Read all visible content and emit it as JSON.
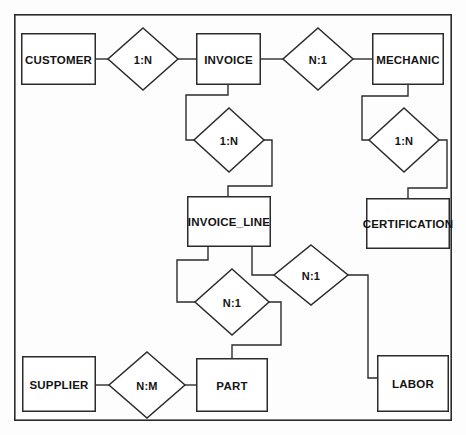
{
  "diagram": {
    "type": "entity-relationship-diagram",
    "title": "",
    "canvas": {
      "width": 466,
      "height": 435,
      "background": "#fdfdfd"
    },
    "frame": {
      "x": 14,
      "y": 14,
      "width": 438,
      "height": 407,
      "stroke": "#2b2b2b"
    },
    "style": {
      "entity_fill": "#ffffff",
      "entity_stroke": "#2b2b2b",
      "relationship_fill": "#ffffff",
      "relationship_stroke": "#2b2b2b",
      "edge_stroke": "#2b2b2b",
      "text_color": "#141414"
    },
    "entities": [
      {
        "id": "customer",
        "label": "CUSTOMER",
        "x": 21,
        "y": 33,
        "width": 75,
        "height": 52
      },
      {
        "id": "invoice",
        "label": "INVOICE",
        "x": 196,
        "y": 33,
        "width": 65,
        "height": 52
      },
      {
        "id": "mechanic",
        "label": "MECHANIC",
        "x": 372,
        "y": 33,
        "width": 72,
        "height": 52
      },
      {
        "id": "invoice_line",
        "label": "INVOICE_LINE",
        "x": 187,
        "y": 196,
        "width": 84,
        "height": 51
      },
      {
        "id": "certification",
        "label": "CERTIFICATION",
        "x": 366,
        "y": 198,
        "width": 84,
        "height": 51
      },
      {
        "id": "supplier",
        "label": "SUPPLIER",
        "x": 22,
        "y": 356,
        "width": 74,
        "height": 56
      },
      {
        "id": "part",
        "label": "PART",
        "x": 196,
        "y": 358,
        "width": 72,
        "height": 54
      },
      {
        "id": "labor",
        "label": "LABOR",
        "x": 377,
        "y": 355,
        "width": 72,
        "height": 57
      }
    ],
    "relationships": [
      {
        "id": "rel-customer-invoice",
        "label": "1:N",
        "cx": 143,
        "cy": 59,
        "rx": 35,
        "ry": 31,
        "from": "customer",
        "to": "invoice"
      },
      {
        "id": "rel-invoice-mechanic",
        "label": "N:1",
        "cx": 318,
        "cy": 59,
        "rx": 35,
        "ry": 31,
        "from": "invoice",
        "to": "mechanic"
      },
      {
        "id": "rel-invoice-invoiceline",
        "label": "1:N",
        "cx": 229,
        "cy": 140,
        "rx": 35,
        "ry": 32,
        "from": "invoice",
        "to": "invoice_line"
      },
      {
        "id": "rel-mechanic-certification",
        "label": "1:N",
        "cx": 404,
        "cy": 140,
        "rx": 35,
        "ry": 32,
        "from": "mechanic",
        "to": "certification"
      },
      {
        "id": "rel-invoiceline-part",
        "label": "N:1",
        "cx": 232,
        "cy": 302,
        "rx": 37,
        "ry": 33,
        "from": "invoice_line",
        "to": "part"
      },
      {
        "id": "rel-invoiceline-labor",
        "label": "N:1",
        "cx": 311,
        "cy": 275,
        "rx": 37,
        "ry": 30,
        "from": "invoice_line",
        "to": "labor"
      },
      {
        "id": "rel-supplier-part",
        "label": "N:M",
        "cx": 147,
        "cy": 385,
        "rx": 38,
        "ry": 33,
        "from": "supplier",
        "to": "part"
      }
    ],
    "edges": [
      {
        "id": "edge-customer-rel1",
        "points": "96,59 108,59"
      },
      {
        "id": "edge-rel1-invoice",
        "points": "178,59 196,59"
      },
      {
        "id": "edge-invoice-rel2",
        "points": "261,59 283,59"
      },
      {
        "id": "edge-rel2-mechanic",
        "points": "353,59 372,59"
      },
      {
        "id": "edge-invoice-rel3",
        "points": "228,85 228,95 186,95 186,140 194,140"
      },
      {
        "id": "edge-rel3-invoiceline",
        "points": "264,140 272,140 272,186 228,186 228,196"
      },
      {
        "id": "edge-mechanic-rel4",
        "points": "408,85 408,96 362,96 362,140 369,140"
      },
      {
        "id": "edge-rel4-certification",
        "points": "439,140 447,140 447,188 408,188 408,198"
      },
      {
        "id": "edge-invoiceline-rel5",
        "points": "208,247 208,260 177,260 177,302 195,302"
      },
      {
        "id": "edge-rel5-part",
        "points": "269,302 281,302 281,345 232,345 232,358"
      },
      {
        "id": "edge-invoiceline-rel6",
        "points": "252,247 252,275 274,275"
      },
      {
        "id": "edge-rel6-labor",
        "points": "348,275 368,275 368,378 377,378"
      },
      {
        "id": "edge-supplier-rel7",
        "points": "96,385 109,385"
      },
      {
        "id": "edge-rel7-part",
        "points": "185,385 196,385"
      }
    ]
  }
}
